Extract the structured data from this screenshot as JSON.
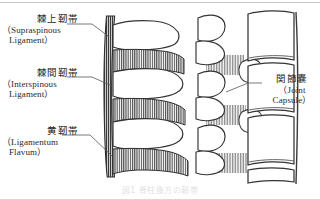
{
  "figure": {
    "title_caption": "図1  脊柱後方の靭帯",
    "labels": [
      {
        "id": "supraspinous",
        "jp": "棘上靭帯",
        "en_line1": "（Supraspinous",
        "en_line2": "Ligament）",
        "side": "left"
      },
      {
        "id": "interspinous",
        "jp": "棘間靭帯",
        "en_line1": "（Interspinous",
        "en_line2": "Ligament）",
        "side": "left"
      },
      {
        "id": "flavum",
        "jp": "黄靭帯",
        "en_line1": "（Ligamentum",
        "en_line2": "Flavum）",
        "side": "left"
      },
      {
        "id": "joint_capsule",
        "jp": "関節嚢",
        "en_line1": "（Joint",
        "en_line2": "Capsule）",
        "side": "right"
      }
    ],
    "colors": {
      "ink": "#2b2b2b",
      "line": "#3a3a3a",
      "hatch": "#4a4a4a",
      "background": "#ffffff",
      "caption": "#e2e2e2"
    },
    "diagram_type": "anatomical-line-drawing"
  }
}
